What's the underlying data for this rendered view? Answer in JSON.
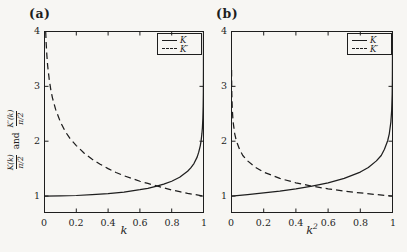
{
  "page": {
    "background": "#f7f6f3",
    "ink": "#1e1e1e"
  },
  "ylabel_parts": {
    "frac1_num": "K(k)",
    "frac1_den": "π/2",
    "conj": "and",
    "frac2_num": "K′(k)",
    "frac2_den": "π/2"
  },
  "chart_data": [
    {
      "type": "line",
      "title": "(a)",
      "xlabel": "k",
      "xlabel_base": "k",
      "xlabel_sup": "",
      "ylabel": "K(k)/(π/2) and K′(k)/(π/2)",
      "xlim": [
        0,
        1
      ],
      "ylim": [
        0.7,
        4
      ],
      "xticks": [
        0,
        0.2,
        0.4,
        0.6,
        0.8,
        1
      ],
      "yticks": [
        1,
        2,
        3,
        4
      ],
      "grid": false,
      "legend_position": "top-right",
      "legend": [
        "K",
        "K′"
      ],
      "series": [
        {
          "name": "K",
          "style": "solid",
          "points": [
            [
              0,
              1.0
            ],
            [
              0.1,
              1.003
            ],
            [
              0.2,
              1.01
            ],
            [
              0.3,
              1.024
            ],
            [
              0.4,
              1.044
            ],
            [
              0.5,
              1.073
            ],
            [
              0.6,
              1.115
            ],
            [
              0.65,
              1.141
            ],
            [
              0.7,
              1.175
            ],
            [
              0.75,
              1.217
            ],
            [
              0.8,
              1.27
            ],
            [
              0.85,
              1.342
            ],
            [
              0.9,
              1.452
            ],
            [
              0.92,
              1.513
            ],
            [
              0.94,
              1.592
            ],
            [
              0.96,
              1.71
            ],
            [
              0.97,
              1.8
            ],
            [
              0.98,
              1.92
            ],
            [
              0.985,
              2.01
            ],
            [
              0.99,
              2.137
            ],
            [
              0.993,
              2.24
            ],
            [
              0.996,
              2.42
            ],
            [
              0.998,
              2.64
            ],
            [
              0.999,
              2.86
            ],
            [
              0.9995,
              3.08
            ],
            [
              0.9998,
              3.37
            ],
            [
              0.9999,
              3.59
            ],
            [
              0.99996,
              3.88
            ],
            [
              0.99998,
              4.0
            ]
          ]
        },
        {
          "name": "K′",
          "style": "dashed",
          "points": [
            [
              0.0075,
              4.0
            ],
            [
              0.01,
              3.81
            ],
            [
              0.015,
              3.56
            ],
            [
              0.02,
              3.37
            ],
            [
              0.03,
              3.12
            ],
            [
              0.04,
              2.93
            ],
            [
              0.05,
              2.79
            ],
            [
              0.07,
              2.58
            ],
            [
              0.1,
              2.35
            ],
            [
              0.13,
              2.18
            ],
            [
              0.16,
              2.05
            ],
            [
              0.2,
              1.92
            ],
            [
              0.25,
              1.78
            ],
            [
              0.3,
              1.67
            ],
            [
              0.35,
              1.58
            ],
            [
              0.4,
              1.5
            ],
            [
              0.45,
              1.43
            ],
            [
              0.5,
              1.37
            ],
            [
              0.55,
              1.32
            ],
            [
              0.6,
              1.27
            ],
            [
              0.65,
              1.23
            ],
            [
              0.7,
              1.19
            ],
            [
              0.75,
              1.15
            ],
            [
              0.8,
              1.11
            ],
            [
              0.85,
              1.08
            ],
            [
              0.9,
              1.05
            ],
            [
              0.95,
              1.025
            ],
            [
              1,
              1.0
            ]
          ]
        }
      ]
    },
    {
      "type": "line",
      "title": "(b)",
      "xlabel": "k²",
      "xlabel_base": "k",
      "xlabel_sup": "2",
      "ylabel": "",
      "xlim": [
        0,
        1
      ],
      "ylim": [
        0.7,
        4
      ],
      "xticks": [
        0,
        0.2,
        0.4,
        0.6,
        0.8,
        1
      ],
      "yticks": [
        1,
        2,
        3,
        4
      ],
      "grid": false,
      "legend_position": "top-right",
      "legend": [
        "K",
        "K′"
      ],
      "series": [
        {
          "name": "K",
          "style": "solid",
          "points": [
            [
              0,
              1.0
            ],
            [
              0.1,
              1.027
            ],
            [
              0.2,
              1.057
            ],
            [
              0.3,
              1.091
            ],
            [
              0.4,
              1.132
            ],
            [
              0.5,
              1.18
            ],
            [
              0.6,
              1.241
            ],
            [
              0.7,
              1.321
            ],
            [
              0.8,
              1.437
            ],
            [
              0.85,
              1.521
            ],
            [
              0.9,
              1.641
            ],
            [
              0.93,
              1.74
            ],
            [
              0.95,
              1.852
            ],
            [
              0.97,
              2.008
            ],
            [
              0.98,
              2.135
            ],
            [
              0.99,
              2.353
            ],
            [
              0.995,
              2.57
            ],
            [
              0.998,
              2.861
            ],
            [
              0.999,
              3.08
            ],
            [
              0.9995,
              3.3
            ],
            [
              0.9998,
              3.59
            ],
            [
              0.9999,
              3.81
            ],
            [
              0.99997,
              4.0
            ]
          ]
        },
        {
          "name": "K′",
          "style": "dashed",
          "points": [
            [
              0.0005,
              3.3
            ],
            [
              0.001,
              3.08
            ],
            [
              0.002,
              2.861
            ],
            [
              0.005,
              2.57
            ],
            [
              0.01,
              2.353
            ],
            [
              0.02,
              2.135
            ],
            [
              0.03,
              2.008
            ],
            [
              0.05,
              1.852
            ],
            [
              0.07,
              1.74
            ],
            [
              0.1,
              1.641
            ],
            [
              0.15,
              1.521
            ],
            [
              0.2,
              1.437
            ],
            [
              0.3,
              1.321
            ],
            [
              0.4,
              1.241
            ],
            [
              0.5,
              1.18
            ],
            [
              0.6,
              1.132
            ],
            [
              0.7,
              1.091
            ],
            [
              0.8,
              1.057
            ],
            [
              0.9,
              1.027
            ],
            [
              1,
              1.0
            ]
          ]
        }
      ]
    }
  ]
}
